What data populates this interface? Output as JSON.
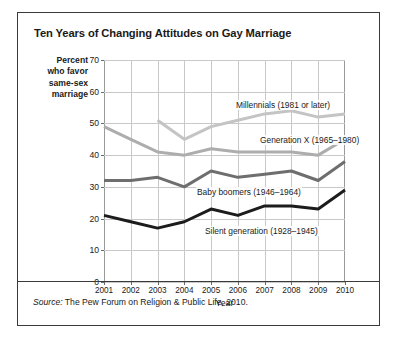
{
  "figure": {
    "title": "Ten Years of Changing Attitudes on Gay Marriage",
    "source_prefix": "Source:",
    "source_text": " The Pew Forum on Religion & Public Life, 2010."
  },
  "chart_data": {
    "type": "line",
    "title": "Ten Years of Changing Attitudes on Gay Marriage",
    "xlabel": "Year",
    "ylabel": "Percent who favor same-sex marriage",
    "ylabel_lines": [
      "Percent",
      "who favor",
      "same-sex",
      "marriage"
    ],
    "x": [
      2001,
      2002,
      2003,
      2004,
      2005,
      2006,
      2007,
      2008,
      2009,
      2010
    ],
    "categories": [
      "2001",
      "2002",
      "2003",
      "2004",
      "2005",
      "2006",
      "2007",
      "2008",
      "2009",
      "2010"
    ],
    "xlim": [
      2001,
      2010
    ],
    "ylim": [
      0,
      70
    ],
    "yticks": [
      0,
      10,
      20,
      30,
      40,
      50,
      60,
      70
    ],
    "ytick_labels": [
      "0",
      "10",
      "20",
      "30",
      "40",
      "50",
      "60",
      "70"
    ],
    "grid": true,
    "legend_position": "inline-labels",
    "series": [
      {
        "name": "Millennials (1981 or later)",
        "label": "Millennials (1981 or later)",
        "color": "#c4c4c4",
        "start_year": 2003,
        "values": [
          null,
          null,
          51,
          45,
          49,
          51,
          53,
          54,
          52,
          53
        ]
      },
      {
        "name": "Generation X (1965–1980)",
        "label": "Generation X (1965–1980)",
        "color": "#adadad",
        "start_year": 2001,
        "values": [
          49,
          45,
          41,
          40,
          42,
          41,
          41,
          41,
          40,
          45
        ]
      },
      {
        "name": "Baby boomers (1946–1964)",
        "label": "Baby boomers (1946–1964)",
        "color": "#6e6e6e",
        "start_year": 2001,
        "values": [
          32,
          32,
          33,
          30,
          35,
          33,
          34,
          35,
          32,
          38
        ]
      },
      {
        "name": "Silent generation (1928–1945)",
        "label": "Silent generation (1928–1945)",
        "color": "#1c1c1c",
        "start_year": 2001,
        "values": [
          21,
          19,
          17,
          19,
          23,
          21,
          24,
          24,
          23,
          29
        ]
      }
    ],
    "series_label_positions": [
      {
        "left": 131,
        "top": 40
      },
      {
        "left": 155,
        "top": 75
      },
      {
        "left": 92,
        "top": 127
      },
      {
        "left": 100,
        "top": 166
      }
    ]
  }
}
